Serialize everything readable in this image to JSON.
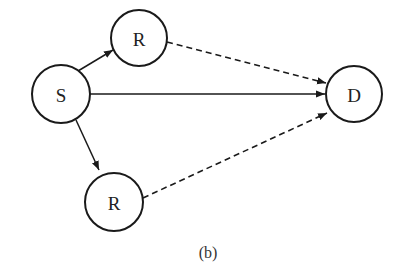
{
  "diagram": {
    "caption": "(b)",
    "nodes": [
      {
        "id": "S",
        "label": "S",
        "cx": 61,
        "cy": 94,
        "r": 29
      },
      {
        "id": "R1",
        "label": "R",
        "cx": 139,
        "cy": 38,
        "r": 28
      },
      {
        "id": "R2",
        "label": "R",
        "cx": 114,
        "cy": 202,
        "r": 29
      },
      {
        "id": "D",
        "label": "D",
        "cx": 354,
        "cy": 94,
        "r": 28
      }
    ],
    "edges": [
      {
        "from": "S",
        "to": "R1",
        "style": "solid"
      },
      {
        "from": "S",
        "to": "R2",
        "style": "solid"
      },
      {
        "from": "S",
        "to": "D",
        "style": "solid"
      },
      {
        "from": "R1",
        "to": "D",
        "style": "dashed"
      },
      {
        "from": "R2",
        "to": "D",
        "style": "dashed"
      }
    ],
    "colors": {
      "stroke": "#1a1a1a",
      "background": "#ffffff"
    }
  }
}
